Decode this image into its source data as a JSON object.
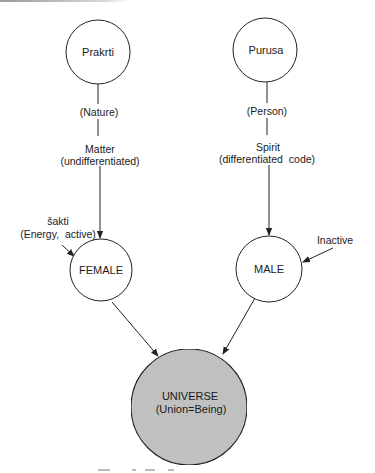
{
  "diagram": {
    "nodes": [
      {
        "id": "prakrti",
        "label": "Prakrti",
        "cx": 98,
        "cy": 52,
        "r": 32
      },
      {
        "id": "purusa",
        "label": "Purusa",
        "cx": 265,
        "cy": 50,
        "r": 32
      },
      {
        "id": "female",
        "label": "FEMALE",
        "cx": 101,
        "cy": 270,
        "r": 31
      },
      {
        "id": "male",
        "label": "MALE",
        "cx": 269,
        "cy": 269,
        "r": 33
      },
      {
        "id": "universe",
        "label_line1": "UNIVERSE",
        "label_line2": "(Union=Being)",
        "cx": 189,
        "cy": 407,
        "r": 58,
        "fill": "#c6c6c6"
      }
    ],
    "left_chain": {
      "nature": "(Nature)",
      "matter": "Matter",
      "matter_sub": "(undifferentiated)"
    },
    "right_chain": {
      "person": "(Person)",
      "spirit": "Spirit",
      "spirit_sub": "(differentiated  code)"
    },
    "side_labels": {
      "sakti": "šakti",
      "energy": "(Energy,  active)",
      "inactive": "Inactive"
    },
    "edges": [
      {
        "from": "prakrti",
        "to": "female",
        "arrow": true
      },
      {
        "from": "purusa",
        "to": "male",
        "arrow": true
      },
      {
        "from": "sakti-label",
        "to": "female",
        "arrow": true
      },
      {
        "from": "inactive-label",
        "to": "male",
        "arrow": true
      },
      {
        "from": "female",
        "to": "universe",
        "arrow": true
      },
      {
        "from": "male",
        "to": "universe",
        "arrow": true
      }
    ]
  }
}
